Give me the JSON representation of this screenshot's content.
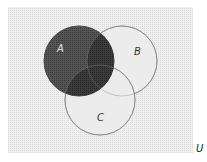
{
  "diagram": {
    "type": "venn",
    "universe_label": "U",
    "sets": [
      {
        "label": "A",
        "shaded": true
      },
      {
        "label": "B",
        "shaded": false
      },
      {
        "label": "C",
        "shaded": false
      }
    ],
    "shaded_region": "A",
    "colors": {
      "background": "#ffffff",
      "universe_fill": "#ececec",
      "circle_fill": "#e6e6e6",
      "a_fill": "#4a4a4a",
      "a_overlap_fill": "#333333",
      "outline": "#8a8a8a",
      "label_light": "#e8e8e8",
      "label_dark": "#333333"
    }
  }
}
